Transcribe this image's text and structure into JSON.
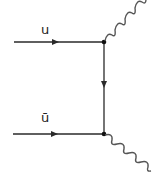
{
  "diagram": {
    "type": "feynman",
    "title": "",
    "particles": {
      "incoming_top": {
        "label": "u",
        "kind": "fermion"
      },
      "incoming_bottom": {
        "label": "ū",
        "kind": "antifermion"
      },
      "propagator": {
        "label": "",
        "kind": "fermion"
      },
      "outgoing_top": {
        "label": "",
        "kind": "photon"
      },
      "outgoing_bottom": {
        "label": "",
        "kind": "photon"
      }
    },
    "colors": {
      "line": "#2a2a2a",
      "photon": "#555555",
      "background": "#ffffff"
    }
  }
}
